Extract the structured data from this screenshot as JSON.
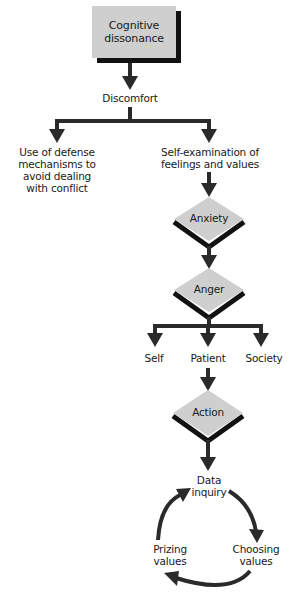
{
  "diagram": {
    "colors": {
      "box_fill": "#cfcfcf",
      "shadow": "#111111",
      "arrow": "#2a2a2a",
      "text": "#1a1a1a",
      "background": "#ffffff"
    },
    "start_node": {
      "lines": [
        "Cognitive",
        "dissonance"
      ],
      "shape": "rectangle"
    },
    "discomfort": {
      "label": "Discomfort"
    },
    "branches": {
      "left": {
        "lines": [
          "Use of defense",
          "mechanisms to",
          "avoid dealing",
          "with conflict"
        ]
      },
      "right": {
        "lines": [
          "Self-examination of",
          "feelings and values"
        ]
      }
    },
    "decisions": [
      {
        "label": "Anxiety",
        "shape": "diamond"
      },
      {
        "label": "Anger",
        "shape": "diamond"
      }
    ],
    "targets": [
      {
        "label": "Self"
      },
      {
        "label": "Patient"
      },
      {
        "label": "Society"
      }
    ],
    "action": {
      "label": "Action",
      "shape": "diamond"
    },
    "cycle": {
      "nodes": [
        {
          "lines": [
            "Data",
            "inquiry"
          ]
        },
        {
          "lines": [
            "Choosing",
            "values"
          ]
        },
        {
          "lines": [
            "Prizing",
            "values"
          ]
        }
      ],
      "direction": "clockwise"
    }
  }
}
